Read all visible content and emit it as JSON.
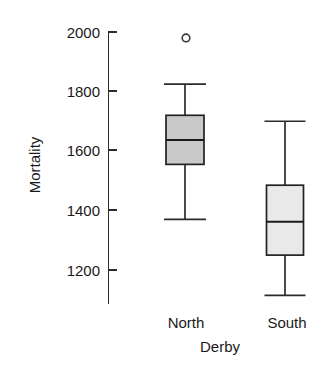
{
  "chart_data": {
    "type": "box",
    "title": "",
    "xlabel": "Derby",
    "ylabel": "Mortality",
    "categories": [
      "North",
      "South"
    ],
    "ylim": [
      1100,
      2020
    ],
    "yticks": [
      1200,
      1400,
      1600,
      1800,
      2000
    ],
    "ytick_labels": [
      "1200",
      "1400",
      "1600",
      "1800",
      "2000"
    ],
    "grid": false,
    "legend": "none",
    "boxes": [
      {
        "name": "North",
        "whisker_low": 1370,
        "q1": 1555,
        "median": 1637,
        "q3": 1720,
        "whisker_high": 1825,
        "outliers": [
          1980
        ],
        "fill": "#c9c9c9"
      },
      {
        "name": "South",
        "whisker_low": 1115,
        "q1": 1250,
        "median": 1362,
        "q3": 1485,
        "whisker_high": 1700,
        "outliers": [],
        "fill": "#e9e9e9"
      }
    ]
  },
  "axes": {
    "y_title": "Mortality",
    "x_title": "Derby",
    "tick_0": "1200",
    "tick_1": "1400",
    "tick_2": "1600",
    "tick_3": "1800",
    "tick_4": "2000"
  },
  "labels": {
    "category_0": "North",
    "category_1": "South"
  },
  "colors": {
    "axis": "#2b2b2b",
    "text": "#1a1a1a",
    "box_north_fill": "#c9c9c9",
    "box_south_fill": "#e9e9e9",
    "box_stroke": "#222222",
    "outlier_stroke": "#3a3a3a"
  }
}
